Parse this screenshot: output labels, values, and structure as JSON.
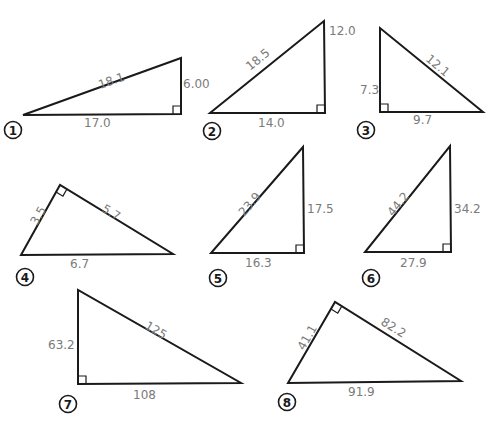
{
  "colors": {
    "line": "#1a1a1a",
    "label": "#7a7a7a",
    "background": "#ffffff"
  },
  "triangles": [
    {
      "number": "1",
      "vertices": [
        [
          23,
          115
        ],
        [
          181,
          114
        ],
        [
          181,
          58
        ]
      ],
      "right_angle": {
        "vertex": [
          181,
          114
        ],
        "dirs": [
          [
            -1,
            0
          ],
          [
            0,
            -1
          ]
        ]
      },
      "labels": [
        {
          "text": "18.1",
          "x": 100,
          "y": 89,
          "rotate": -19,
          "role": "hypotenuse"
        },
        {
          "text": "6.00",
          "x": 183,
          "y": 88,
          "rotate": 0,
          "role": "leg"
        },
        {
          "text": "17.0",
          "x": 84,
          "y": 127,
          "rotate": 0,
          "role": "leg"
        }
      ],
      "badge": {
        "x": 13,
        "y": 130
      }
    },
    {
      "number": "2",
      "vertices": [
        [
          210,
          113
        ],
        [
          325,
          113
        ],
        [
          324,
          21
        ]
      ],
      "right_angle": {
        "vertex": [
          325,
          113
        ],
        "dirs": [
          [
            -1,
            0
          ],
          [
            0,
            -1
          ]
        ]
      },
      "labels": [
        {
          "text": "18.5",
          "x": 250,
          "y": 71,
          "rotate": -39,
          "role": "hypotenuse"
        },
        {
          "text": "12.0",
          "x": 329,
          "y": 35,
          "rotate": 0,
          "role": "leg"
        },
        {
          "text": "14.0",
          "x": 258,
          "y": 127,
          "rotate": 0,
          "role": "leg"
        }
      ],
      "badge": {
        "x": 212,
        "y": 131
      }
    },
    {
      "number": "3",
      "vertices": [
        [
          380,
          28
        ],
        [
          380,
          112
        ],
        [
          483,
          112
        ]
      ],
      "right_angle": {
        "vertex": [
          380,
          112
        ],
        "dirs": [
          [
            1,
            0
          ],
          [
            0,
            -1
          ]
        ]
      },
      "labels": [
        {
          "text": "12.1",
          "x": 425,
          "y": 60,
          "rotate": 40,
          "role": "hypotenuse"
        },
        {
          "text": "7.3",
          "x": 360,
          "y": 94,
          "rotate": 0,
          "role": "leg"
        },
        {
          "text": "9.7",
          "x": 413,
          "y": 124,
          "rotate": 0,
          "role": "leg"
        }
      ],
      "badge": {
        "x": 366,
        "y": 130
      }
    },
    {
      "number": "4",
      "vertices": [
        [
          21,
          255
        ],
        [
          60,
          185
        ],
        [
          173,
          254
        ]
      ],
      "right_angle": {
        "vertex": [
          60,
          185
        ],
        "dirs": [
          [
            -0.487,
            0.873
          ],
          [
            0.853,
            0.522
          ]
        ]
      },
      "labels": [
        {
          "text": "3.5",
          "x": 37,
          "y": 226,
          "rotate": -60,
          "role": "leg"
        },
        {
          "text": "5.7",
          "x": 101,
          "y": 211,
          "rotate": 31,
          "role": "leg"
        },
        {
          "text": "6.7",
          "x": 70,
          "y": 268,
          "rotate": 0,
          "role": "hypotenuse"
        }
      ],
      "badge": {
        "x": 25,
        "y": 277
      }
    },
    {
      "number": "5",
      "vertices": [
        [
          211,
          253
        ],
        [
          304,
          253
        ],
        [
          303,
          147
        ]
      ],
      "right_angle": {
        "vertex": [
          304,
          253
        ],
        "dirs": [
          [
            -1,
            0
          ],
          [
            0,
            -1
          ]
        ]
      },
      "labels": [
        {
          "text": "23.9",
          "x": 244,
          "y": 217,
          "rotate": -49,
          "role": "hypotenuse"
        },
        {
          "text": "17.5",
          "x": 307,
          "y": 213,
          "rotate": 0,
          "role": "leg"
        },
        {
          "text": "16.3",
          "x": 245,
          "y": 267,
          "rotate": 0,
          "role": "leg"
        }
      ],
      "badge": {
        "x": 218,
        "y": 278
      }
    },
    {
      "number": "6",
      "vertices": [
        [
          365,
          252
        ],
        [
          451,
          252
        ],
        [
          450,
          146
        ]
      ],
      "right_angle": {
        "vertex": [
          451,
          252
        ],
        "dirs": [
          [
            -1,
            0
          ],
          [
            0,
            -1
          ]
        ]
      },
      "labels": [
        {
          "text": "44.2",
          "x": 393,
          "y": 217,
          "rotate": -51,
          "role": "hypotenuse"
        },
        {
          "text": "34.2",
          "x": 454,
          "y": 213,
          "rotate": 0,
          "role": "leg"
        },
        {
          "text": "27.9",
          "x": 400,
          "y": 267,
          "rotate": 0,
          "role": "leg"
        }
      ],
      "badge": {
        "x": 371,
        "y": 278
      }
    },
    {
      "number": "7",
      "vertices": [
        [
          78,
          290
        ],
        [
          78,
          384
        ],
        [
          241,
          383
        ]
      ],
      "right_angle": {
        "vertex": [
          78,
          384
        ],
        "dirs": [
          [
            1,
            0
          ],
          [
            0,
            -1
          ]
        ]
      },
      "labels": [
        {
          "text": "125",
          "x": 144,
          "y": 328,
          "rotate": 30,
          "role": "hypotenuse"
        },
        {
          "text": "63.2",
          "x": 48,
          "y": 349,
          "rotate": 0,
          "role": "leg"
        },
        {
          "text": "108",
          "x": 133,
          "y": 399,
          "rotate": 0,
          "role": "leg"
        }
      ],
      "badge": {
        "x": 68,
        "y": 404
      }
    },
    {
      "number": "8",
      "vertices": [
        [
          288,
          383
        ],
        [
          335,
          302
        ],
        [
          461,
          381
        ]
      ],
      "right_angle": {
        "vertex": [
          335,
          302
        ],
        "dirs": [
          [
            -0.502,
            0.865
          ],
          [
            0.847,
            0.532
          ]
        ]
      },
      "labels": [
        {
          "text": "41.1",
          "x": 304,
          "y": 351,
          "rotate": -60,
          "role": "leg"
        },
        {
          "text": "82.2",
          "x": 380,
          "y": 324,
          "rotate": 32,
          "role": "leg"
        },
        {
          "text": "91.9",
          "x": 348,
          "y": 396,
          "rotate": 0,
          "role": "hypotenuse"
        }
      ],
      "badge": {
        "x": 287,
        "y": 402
      }
    }
  ]
}
